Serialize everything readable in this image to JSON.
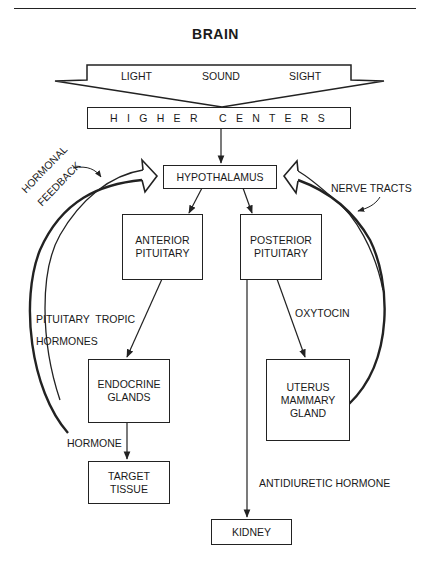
{
  "title": "BRAIN",
  "senses": [
    "LIGHT",
    "SOUND",
    "SIGHT"
  ],
  "boxes": {
    "higher_centers": "H I G H E R   C E N T E R S",
    "hypothalamus": "HYPOTHALAMUS",
    "anterior_pituitary": [
      "ANTERIOR",
      "PITUITARY"
    ],
    "posterior_pituitary": [
      "POSTERIOR",
      "PITUITARY"
    ],
    "endocrine_glands": [
      "ENDOCRINE",
      "GLANDS"
    ],
    "uterus_mammary_gland": [
      "UTERUS",
      "MAMMARY",
      "GLAND"
    ],
    "target_tissue": [
      "TARGET",
      "TISSUE"
    ],
    "kidney": "KIDNEY"
  },
  "labels": {
    "hormonal": "HORMONAL",
    "feedback": "FEEDBACK",
    "nerve_tracts": "NERVE TRACTS",
    "pituitary_tropic": "PITUITARY  TROPIC",
    "hormones": "HORMONES",
    "oxytocin": "OXYTOCIN",
    "hormone": "HORMONE",
    "antidiuretic_hormone": "ANTIDIURETIC HORMONE"
  },
  "colors": {
    "ink": "#222222",
    "background": "#ffffff"
  }
}
